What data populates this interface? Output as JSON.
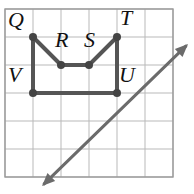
{
  "figure": {
    "canvas": {
      "width": 194,
      "height": 194,
      "background": "#ffffff"
    },
    "grid": {
      "spacing": 28,
      "x_lines": [
        5,
        33,
        61,
        89,
        117,
        145,
        173
      ],
      "y_lines": [
        9,
        37,
        65,
        93,
        121,
        149,
        177
      ],
      "line_color": "#b9b9b9",
      "border_color": "#9a9a9a",
      "border": {
        "x": 5,
        "y": 9,
        "width": 168,
        "height": 168
      }
    },
    "shape": {
      "name": "QRSTUV",
      "stroke_color": "#555555",
      "stroke_width": 4,
      "vertex_dot_color": "#444444",
      "vertex_dot_radius": 4,
      "closed": true,
      "vertices": [
        {
          "id": "Q",
          "label": "Q",
          "x": 33,
          "y": 37,
          "label_x": 8,
          "label_y": 9
        },
        {
          "id": "R",
          "label": "R",
          "x": 61,
          "y": 65,
          "label_x": 55,
          "label_y": 29
        },
        {
          "id": "S",
          "label": "S",
          "x": 89,
          "y": 65,
          "label_x": 84,
          "label_y": 29
        },
        {
          "id": "T",
          "label": "T",
          "x": 117,
          "y": 37,
          "label_x": 120,
          "label_y": 7
        },
        {
          "id": "U",
          "label": "U",
          "x": 117,
          "y": 93,
          "label_x": 119,
          "label_y": 64
        },
        {
          "id": "V",
          "label": "V",
          "x": 33,
          "y": 93,
          "label_x": 8,
          "label_y": 64
        }
      ]
    },
    "arrow": {
      "name": "diagonal-double-arrow",
      "stroke_color": "#6b6b6b",
      "stroke_width": 3,
      "x1": 42,
      "y1": 186,
      "x2": 188,
      "y2": 44,
      "double_headed": true
    }
  }
}
